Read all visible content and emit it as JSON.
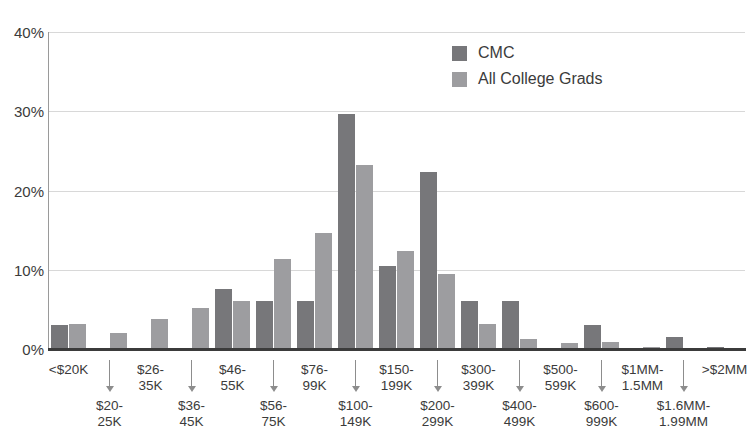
{
  "chart_data": {
    "type": "bar",
    "title": "",
    "subtitle": "",
    "xlabel": "",
    "ylabel": "",
    "ylim": [
      0,
      40
    ],
    "yticks": [
      "0%",
      "10%",
      "20%",
      "30%",
      "40%"
    ],
    "ytick_values": [
      0,
      10,
      20,
      30,
      40
    ],
    "grid": true,
    "legend_position": "top-center-right",
    "categories": [
      "<$20K",
      "$20-\n25K",
      "$26-\n35K",
      "$36-\n45K",
      "$46-\n55K",
      "$56-\n75K",
      "$76-\n99K",
      "$100-\n149K",
      "$150-\n199K",
      "$200-\n299K",
      "$300-\n399K",
      "$400-\n499K",
      "$500-\n599K",
      "$600-\n999K",
      "$1MM-\n1.5MM",
      "$1.6MM-\n1.99MM",
      ">$2MM"
    ],
    "series": [
      {
        "name": "CMC",
        "color": "#77777a",
        "values": [
          3.0,
          0.0,
          0.0,
          0.0,
          7.6,
          6.1,
          6.1,
          29.6,
          10.5,
          22.3,
          6.1,
          6.1,
          0.0,
          3.0,
          0.0,
          1.5,
          0.2
        ]
      },
      {
        "name": "All College Grads",
        "color": "#9d9da0",
        "values": [
          3.1,
          2.0,
          3.8,
          5.2,
          6.1,
          11.3,
          14.7,
          23.2,
          12.4,
          9.5,
          3.1,
          1.3,
          0.8,
          0.9,
          0.2,
          0.1,
          0.1
        ]
      }
    ]
  },
  "legend": {
    "entries": [
      {
        "label": "CMC",
        "swatch": "legend-swatch-cmc"
      },
      {
        "label": "All College Grads",
        "swatch": "legend-swatch-grads"
      }
    ]
  },
  "colors": {
    "cmc": "#77777a",
    "grads": "#9d9da0",
    "grid": "#d8d8d8",
    "axis": "#3b3b3b",
    "background": "#ffffff"
  }
}
